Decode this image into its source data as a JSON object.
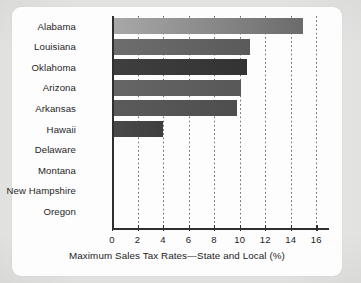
{
  "chart_data": {
    "type": "bar",
    "orientation": "horizontal",
    "title": "",
    "xlabel": "Maximum Sales Tax Rates—State and Local (%)",
    "ylabel": "",
    "xlim": [
      0,
      17
    ],
    "xticks": [
      0,
      2,
      4,
      6,
      8,
      10,
      12,
      14,
      16
    ],
    "xticklabels": [
      "0",
      "2",
      "4",
      "6",
      "8",
      "10",
      "12",
      "14",
      "16"
    ],
    "grid": "vertical-dotted",
    "legend": "none",
    "categories": [
      "Alabama",
      "Louisiana",
      "Oklahoma",
      "Arizona",
      "Arkansas",
      "Hawaii",
      "Delaware",
      "Montana",
      "New Hampshire",
      "Oregon"
    ],
    "values": [
      15.0,
      10.8,
      10.6,
      10.1,
      9.8,
      4.0,
      0,
      0,
      0,
      0
    ],
    "bar_colors": [
      "#a9a9a9",
      "#6e6e6e",
      "#3f3f3f",
      "#666666",
      "#5b5b5b",
      "#4a4a4a",
      "#808080",
      "#808080",
      "#808080",
      "#808080"
    ],
    "bar_colors_end": [
      "#6b6b6b",
      "#5a5a5a",
      "#333333",
      "#585858",
      "#4e4e4e",
      "#3e3e3e",
      "#808080",
      "#808080",
      "#808080",
      "#808080"
    ]
  },
  "colors": {
    "axis": "#2f2f2f",
    "grid": "#6e6e6e",
    "text": "#1c1c1c",
    "card_background": "#fdfdfd",
    "page_background": "#e9e9e8"
  }
}
